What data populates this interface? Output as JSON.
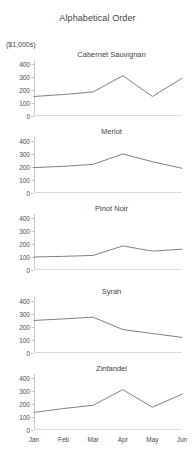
{
  "chart_data": {
    "type": "line",
    "title": "Alphabetical Order",
    "ylabel": "($1,000s)",
    "xlabel": "",
    "categories": [
      "Jan",
      "Feb",
      "Mar",
      "Apr",
      "May",
      "Jun"
    ],
    "yticks": [
      0,
      100,
      200,
      300,
      400
    ],
    "ylim": [
      0,
      430
    ],
    "grid": false,
    "legend": "none",
    "layout": "small-multiples-vertical-stack",
    "line_color": "#808080",
    "panels": [
      {
        "name": "Cabernet Sauvignan",
        "values": [
          150,
          165,
          185,
          310,
          150,
          290
        ]
      },
      {
        "name": "Merlot",
        "values": [
          195,
          205,
          220,
          300,
          240,
          190
        ]
      },
      {
        "name": "Pinot Noir",
        "values": [
          100,
          105,
          112,
          185,
          145,
          160
        ]
      },
      {
        "name": "Syrah",
        "values": [
          250,
          262,
          275,
          180,
          150,
          120
        ]
      },
      {
        "name": "Zinfandel",
        "values": [
          135,
          165,
          190,
          310,
          175,
          275
        ]
      }
    ]
  }
}
